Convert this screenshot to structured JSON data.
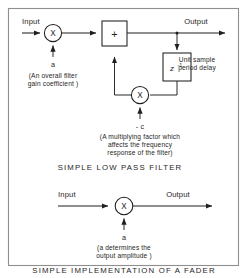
{
  "figure": {
    "frame": {
      "label": "figure-border"
    },
    "diagram_low_pass": {
      "title": "SIMPLE LOW PASS FILTER",
      "input_label": "Input",
      "output_label": "Output",
      "gain_multiplier_symbol": "X",
      "gain_coefficient_label": "a",
      "gain_coefficient_note_line1": "(An overall filter",
      "gain_coefficient_note_line2": "gain coefficient )",
      "adder_symbol": "+",
      "delay_symbol": "z",
      "delay_exponent": "-1",
      "delay_note_line1": "Unit sample",
      "delay_note_line2": "period delay",
      "feedback_multiplier_symbol": "X",
      "feedback_coefficient_label": "- c",
      "feedback_note_line1": "(A multiplying factor which",
      "feedback_note_line2": "affects the frequency",
      "feedback_note_line3": "response of the filter)"
    },
    "diagram_fader": {
      "title": "SIMPLE IMPLEMENTATION OF A FADER",
      "input_label": "Input",
      "output_label": "Output",
      "multiplier_symbol": "X",
      "coefficient_label": "a",
      "note_line1": "(a determines the",
      "note_line2": "output amplitude )"
    }
  },
  "colors": {
    "ink": "#1f1f1f",
    "text": "#262626",
    "frame": "#8f8f8f",
    "paper": "#ffffff"
  }
}
